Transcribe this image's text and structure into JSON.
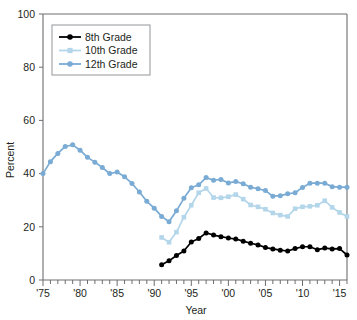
{
  "chart_data": {
    "type": "line",
    "title": "",
    "xlabel": "Year",
    "ylabel": "Percent",
    "xlim": [
      1975,
      2016
    ],
    "ylim": [
      0,
      100
    ],
    "yticks": [
      0,
      20,
      40,
      60,
      80,
      100
    ],
    "ytick_labels": [
      "0",
      "20",
      "40",
      "60",
      "80",
      "100"
    ],
    "xtick_labels": [
      "'75",
      "'80",
      "'85",
      "'90",
      "'95",
      "'00",
      "'05",
      "'10",
      "'15"
    ],
    "xtick_values": [
      1975,
      1980,
      1985,
      1990,
      1995,
      2000,
      2005,
      2010,
      2015
    ],
    "minor_xticks_interval": 1,
    "grid": false,
    "legend_position": "top-left",
    "series": [
      {
        "name": "8th Grade",
        "color": "#000000",
        "marker": "circle",
        "x": [
          1991,
          1992,
          1993,
          1994,
          1995,
          1996,
          1997,
          1998,
          1999,
          2000,
          2001,
          2002,
          2003,
          2004,
          2005,
          2006,
          2007,
          2008,
          2009,
          2010,
          2011,
          2012,
          2013,
          2014,
          2015,
          2016
        ],
        "values": [
          5.7,
          7.2,
          9.2,
          10.9,
          14.3,
          15.6,
          17.7,
          16.9,
          16.3,
          15.8,
          15.4,
          14.6,
          13.8,
          13.2,
          12.2,
          11.7,
          11.2,
          10.9,
          11.8,
          12.5,
          12.5,
          11.4,
          12.0,
          11.7,
          11.8,
          9.4
        ]
      },
      {
        "name": "10th Grade",
        "color": "#b3d6ea",
        "marker": "square",
        "x": [
          1991,
          1992,
          1993,
          1994,
          1995,
          1996,
          1997,
          1998,
          1999,
          2000,
          2001,
          2002,
          2003,
          2004,
          2005,
          2006,
          2007,
          2008,
          2009,
          2010,
          2011,
          2012,
          2013,
          2014,
          2015,
          2016
        ],
        "values": [
          16.0,
          14.2,
          18.0,
          23.6,
          28.1,
          32.8,
          34.4,
          31.0,
          30.9,
          31.3,
          32.1,
          30.4,
          28.2,
          27.5,
          26.6,
          25.2,
          24.4,
          23.9,
          26.8,
          27.5,
          27.7,
          28.1,
          29.8,
          27.3,
          25.4,
          23.9
        ]
      },
      {
        "name": "12th Grade",
        "color": "#7aabd4",
        "marker": "circle",
        "x": [
          1975,
          1976,
          1977,
          1978,
          1979,
          1980,
          1981,
          1982,
          1983,
          1984,
          1985,
          1986,
          1987,
          1988,
          1989,
          1990,
          1991,
          1992,
          1993,
          1994,
          1995,
          1996,
          1997,
          1998,
          1999,
          2000,
          2001,
          2002,
          2003,
          2004,
          2005,
          2006,
          2007,
          2008,
          2009,
          2010,
          2011,
          2012,
          2013,
          2014,
          2015,
          2016
        ],
        "values": [
          40.0,
          44.5,
          47.6,
          50.2,
          50.8,
          48.8,
          46.1,
          44.3,
          42.3,
          40.0,
          40.6,
          38.8,
          36.3,
          33.1,
          29.6,
          27.0,
          23.9,
          21.9,
          26.0,
          30.7,
          34.7,
          35.8,
          38.5,
          37.5,
          37.8,
          36.5,
          37.0,
          36.2,
          34.9,
          34.3,
          33.6,
          31.5,
          31.7,
          32.4,
          32.8,
          34.8,
          36.4,
          36.4,
          36.4,
          35.1,
          34.9,
          34.9
        ]
      }
    ]
  },
  "legend": {
    "items": [
      {
        "label": "8th Grade",
        "color": "#000000",
        "marker": "circle"
      },
      {
        "label": "10th Grade",
        "color": "#b3d6ea",
        "marker": "square"
      },
      {
        "label": "12th Grade",
        "color": "#7aabd4",
        "marker": "circle"
      }
    ]
  },
  "colors": {
    "grade8": "#000000",
    "grade10": "#b3d6ea",
    "grade12": "#7aabd4",
    "axis": "#6d6e71",
    "text": "#231f20",
    "background": "#ffffff"
  }
}
